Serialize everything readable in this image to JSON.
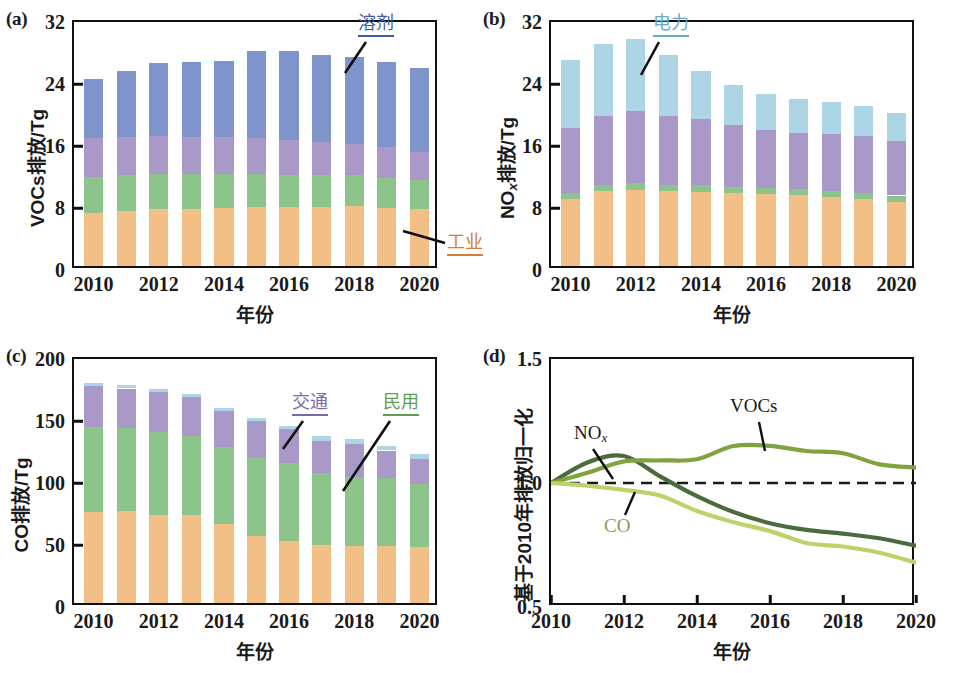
{
  "figure": {
    "panels": [
      "a",
      "b",
      "c",
      "d"
    ],
    "xlabel": "年份",
    "colors": {
      "industry": "#f2bf86",
      "residential": "#8cc48c",
      "transport": "#a899c9",
      "solvent": "#8094cc",
      "power": "#aed5e6",
      "nox_line": "#4c6b3c",
      "vocs_line": "#7fa33f",
      "co_line": "#bdd268",
      "axis": "#101010"
    }
  },
  "panel_a": {
    "tag": "(a)",
    "ylabel": "VOCs排放/Tg",
    "xlabel": "年份",
    "annotations": [
      {
        "name": "solvent",
        "text": "溶剂",
        "color": "#3b5ba8"
      },
      {
        "name": "industry",
        "text": "工业",
        "color": "#d08030"
      }
    ]
  },
  "panel_b": {
    "tag": "(b)",
    "ylabel_prefix": "NO",
    "ylabel_sub": "x",
    "ylabel_suffix": "排放/Tg",
    "xlabel": "年份",
    "annotations": [
      {
        "name": "power",
        "text": "电力",
        "color": "#6aa8cc"
      }
    ]
  },
  "panel_c": {
    "tag": "(c)",
    "ylabel": "CO排放/Tg",
    "xlabel": "年份",
    "annotations": [
      {
        "name": "transport",
        "text": "交通",
        "color": "#7a6aa8"
      },
      {
        "name": "residential",
        "text": "民用",
        "color": "#5f9e4f"
      }
    ]
  },
  "panel_d": {
    "tag": "(d)",
    "ylabel": "基于2010年排放归一化",
    "xlabel": "年份",
    "series_labels": [
      {
        "name": "nox",
        "text": "NO",
        "sub": "x",
        "color": "#1a1a1a"
      },
      {
        "name": "vocs",
        "text": "VOCs",
        "sub": "",
        "color": "#1a1a1a"
      },
      {
        "name": "co",
        "text": "CO",
        "sub": "",
        "color": "#8a9a5a"
      }
    ]
  },
  "chart_data": [
    {
      "panel": "a",
      "type": "bar",
      "stacked": true,
      "title": "",
      "xlabel": "年份",
      "ylabel": "VOCs排放/Tg",
      "x": [
        2010,
        2011,
        2012,
        2013,
        2014,
        2015,
        2016,
        2017,
        2018,
        2019,
        2020
      ],
      "xticks": [
        2010,
        2012,
        2014,
        2016,
        2018,
        2020
      ],
      "xlim": [
        2009.4,
        2020.6
      ],
      "ylim": [
        0,
        32
      ],
      "yticks": [
        0,
        8,
        16,
        24,
        32
      ],
      "grid": false,
      "series": [
        {
          "name": "工业",
          "key": "industry",
          "color": "#f2bf86",
          "values": [
            6.8,
            7.1,
            7.3,
            7.4,
            7.5,
            7.6,
            7.6,
            7.6,
            7.7,
            7.5,
            7.3
          ]
        },
        {
          "name": "民用",
          "key": "residential",
          "color": "#8cc48c",
          "values": [
            4.7,
            4.6,
            4.6,
            4.5,
            4.4,
            4.3,
            4.2,
            4.1,
            4.0,
            3.9,
            3.8
          ]
        },
        {
          "name": "交通",
          "key": "transport",
          "color": "#a899c9",
          "values": [
            5.0,
            4.9,
            4.9,
            4.8,
            4.7,
            4.6,
            4.5,
            4.3,
            4.1,
            3.9,
            3.6
          ]
        },
        {
          "name": "溶剂",
          "key": "solvent",
          "color": "#8094cc",
          "values": [
            7.6,
            8.5,
            9.4,
            9.6,
            9.8,
            11.2,
            11.4,
            11.2,
            11.2,
            11.0,
            10.9
          ]
        }
      ],
      "totals": [
        24.1,
        25.1,
        26.2,
        26.3,
        26.4,
        27.7,
        27.7,
        27.2,
        27.0,
        25.9,
        25.6
      ]
    },
    {
      "panel": "b",
      "type": "bar",
      "stacked": true,
      "title": "",
      "xlabel": "年份",
      "ylabel": "NOx排放/Tg",
      "x": [
        2010,
        2011,
        2012,
        2013,
        2014,
        2015,
        2016,
        2017,
        2018,
        2019,
        2020
      ],
      "xticks": [
        2010,
        2012,
        2014,
        2016,
        2018,
        2020
      ],
      "xlim": [
        2009.4,
        2020.6
      ],
      "ylim": [
        0,
        32
      ],
      "yticks": [
        0,
        8,
        16,
        24,
        32
      ],
      "grid": false,
      "series": [
        {
          "name": "工业",
          "key": "industry",
          "color": "#f2bf86",
          "values": [
            8.7,
            9.7,
            9.8,
            9.7,
            9.6,
            9.4,
            9.3,
            9.2,
            8.9,
            8.6,
            8.3
          ]
        },
        {
          "name": "民用",
          "key": "residential",
          "color": "#8cc48c",
          "values": [
            0.75,
            0.8,
            0.85,
            0.8,
            0.8,
            0.8,
            0.8,
            0.8,
            0.8,
            0.8,
            0.8
          ]
        },
        {
          "name": "交通",
          "key": "transport",
          "color": "#a899c9",
          "values": [
            8.4,
            8.9,
            9.4,
            8.9,
            8.6,
            8.0,
            7.5,
            7.1,
            7.3,
            7.4,
            7.0
          ]
        },
        {
          "name": "电力",
          "key": "power",
          "color": "#aed5e6",
          "values": [
            8.7,
            9.3,
            9.3,
            7.8,
            6.1,
            5.2,
            4.6,
            4.4,
            4.1,
            3.8,
            3.7
          ]
        }
      ],
      "totals": [
        26.5,
        28.7,
        29.4,
        27.2,
        25.1,
        23.4,
        22.2,
        21.5,
        21.1,
        20.6,
        19.8
      ]
    },
    {
      "panel": "c",
      "type": "bar",
      "stacked": true,
      "title": "",
      "xlabel": "年份",
      "ylabel": "CO排放/Tg",
      "x": [
        2010,
        2011,
        2012,
        2013,
        2014,
        2015,
        2016,
        2017,
        2018,
        2019,
        2020
      ],
      "xticks": [
        2010,
        2012,
        2014,
        2016,
        2018,
        2020
      ],
      "xlim": [
        2009.4,
        2020.6
      ],
      "ylim": [
        0,
        200
      ],
      "yticks": [
        0,
        50,
        100,
        150,
        200
      ],
      "grid": false,
      "series": [
        {
          "name": "工业",
          "key": "industry",
          "color": "#f2bf86",
          "values": [
            73,
            74,
            71,
            71,
            64,
            54,
            50,
            47,
            46,
            46,
            45
          ]
        },
        {
          "name": "民用",
          "key": "residential",
          "color": "#8cc48c",
          "values": [
            69,
            67,
            67,
            64,
            62,
            63,
            63,
            58,
            56,
            55,
            51
          ]
        },
        {
          "name": "交通",
          "key": "transport",
          "color": "#a899c9",
          "values": [
            33,
            32,
            32,
            31,
            29,
            30,
            27,
            26,
            26,
            22,
            20
          ]
        },
        {
          "name": "电力",
          "key": "power",
          "color": "#aed5e6",
          "values": [
            2.5,
            2.5,
            2.5,
            2.5,
            2.5,
            2.5,
            3.0,
            3.5,
            4.0,
            4.0,
            4.5
          ]
        }
      ],
      "totals": [
        177.5,
        175.5,
        172.5,
        168.5,
        157.5,
        149.5,
        143,
        134.5,
        132,
        127,
        120.5
      ]
    },
    {
      "panel": "d",
      "type": "line",
      "title": "",
      "xlabel": "年份",
      "ylabel": "基于2010年排放归一化",
      "x": [
        2010,
        2011,
        2012,
        2013,
        2014,
        2015,
        2016,
        2017,
        2018,
        2019,
        2020
      ],
      "xticks": [
        2010,
        2012,
        2014,
        2016,
        2018,
        2020
      ],
      "xlim": [
        2010,
        2020
      ],
      "ylim": [
        0.5,
        1.5
      ],
      "yticks": [
        0.5,
        1.0,
        1.5
      ],
      "grid": false,
      "reference_line": {
        "value": 1.0,
        "style": "dashed",
        "color": "#1a1a1a"
      },
      "series": [
        {
          "name": "NOx",
          "key": "nox",
          "color": "#4c6b3c",
          "values": [
            1.0,
            1.083,
            1.109,
            1.026,
            0.947,
            0.883,
            0.838,
            0.811,
            0.796,
            0.777,
            0.747
          ]
        },
        {
          "name": "VOCs",
          "key": "vocs",
          "color": "#7fa33f",
          "values": [
            1.0,
            1.041,
            1.087,
            1.091,
            1.096,
            1.149,
            1.15,
            1.129,
            1.12,
            1.075,
            1.062
          ]
        },
        {
          "name": "CO",
          "key": "co",
          "color": "#bdd268",
          "values": [
            1.0,
            0.989,
            0.972,
            0.949,
            0.887,
            0.842,
            0.806,
            0.758,
            0.744,
            0.719,
            0.679
          ]
        }
      ]
    }
  ]
}
